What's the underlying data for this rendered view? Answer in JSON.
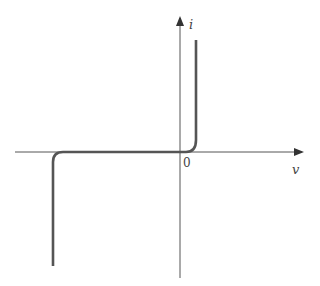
{
  "diagram": {
    "title": "",
    "type": "diode i-v characteristic",
    "axes": {
      "x_label": "v",
      "y_label": "i",
      "origin_label": "0"
    },
    "colors": {
      "axis": "#555555",
      "curve": "#555555",
      "background": "#ffffff"
    },
    "curve_description": "Forward conduction rises sharply just right of origin; near-zero current for reverse bias; sharp reverse breakdown at large negative voltage"
  }
}
